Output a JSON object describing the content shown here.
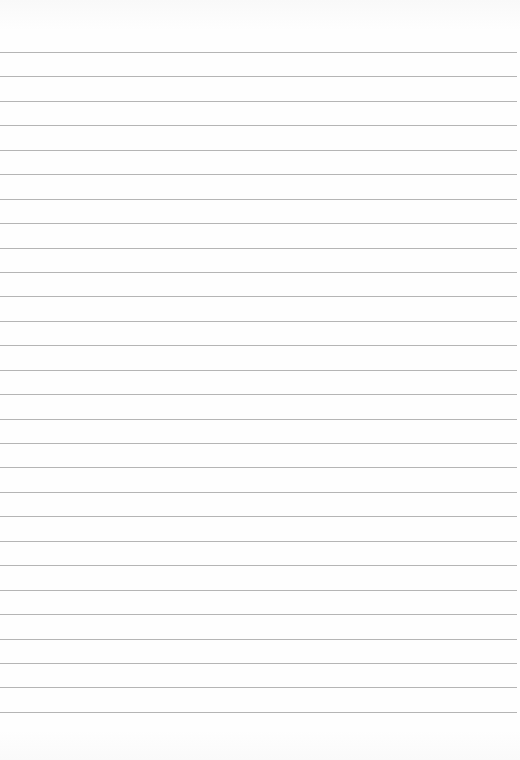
{
  "paper": {
    "kind": "lined-paper",
    "background_color": "#fdfdfd",
    "rule_color": "#a8a8a8",
    "rule_count": 28,
    "first_rule_y": 52,
    "rule_spacing": 24.44
  }
}
